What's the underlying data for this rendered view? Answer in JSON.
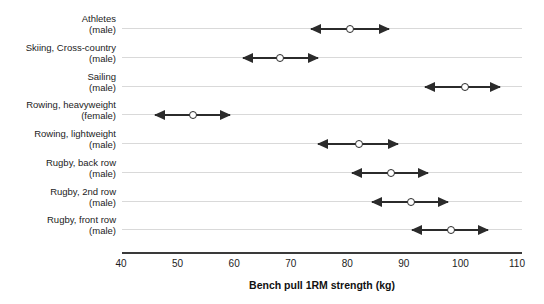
{
  "chart_data": {
    "type": "scatter",
    "title": "",
    "xlabel": "Bench pull 1RM strength (kg)",
    "ylabel": "",
    "xlim": [
      40,
      110
    ],
    "xticks": [
      40,
      50,
      60,
      70,
      80,
      90,
      100,
      110
    ],
    "xtick_labels": [
      "40",
      "50",
      "60",
      "70",
      "80",
      "90",
      "100",
      "110"
    ],
    "grid": true,
    "legend": false,
    "units": "kg",
    "marker_style": "open-circle",
    "interval_style": "double-headed-arrow",
    "categories": [
      "Athletes (male)",
      "Skiing, Cross-country (male)",
      "Sailing (male)",
      "Rowing, heavyweight (female)",
      "Rowing, lightweight (male)",
      "Rugby, back row (male)",
      "Rugby, 2nd row (male)",
      "Rugby, front row (male)"
    ],
    "rows": [
      {
        "group": "Athletes",
        "sex": "(male)",
        "mean": 80.5,
        "low": 73.6,
        "high": 87.4
      },
      {
        "group": "Skiing, Cross-country",
        "sex": "(male)",
        "mean": 68.1,
        "low": 61.6,
        "high": 74.8
      },
      {
        "group": "Sailing",
        "sex": "(male)",
        "mean": 100.8,
        "low": 93.7,
        "high": 107.0
      },
      {
        "group": "Rowing, heavyweight",
        "sex": "(female)",
        "mean": 52.7,
        "low": 46.0,
        "high": 59.3
      },
      {
        "group": "Rowing, lightweight",
        "sex": "(male)",
        "mean": 82.1,
        "low": 74.8,
        "high": 88.9
      },
      {
        "group": "Rugby, back row",
        "sex": "(male)",
        "mean": 87.7,
        "low": 80.8,
        "high": 94.3
      },
      {
        "group": "Rugby, 2nd row",
        "sex": "(male)",
        "mean": 91.2,
        "low": 84.4,
        "high": 97.8
      },
      {
        "group": "Rugby, front row",
        "sex": "(male)",
        "mean": 98.3,
        "low": 91.4,
        "high": 104.9
      }
    ],
    "colors": {
      "marker": "#2b2b2b",
      "interval": "#2b2b2b",
      "gridline": "#d9d9d9",
      "axis": "#3a3a3a",
      "text": "#1c1c1c",
      "background": "#ffffff"
    }
  }
}
